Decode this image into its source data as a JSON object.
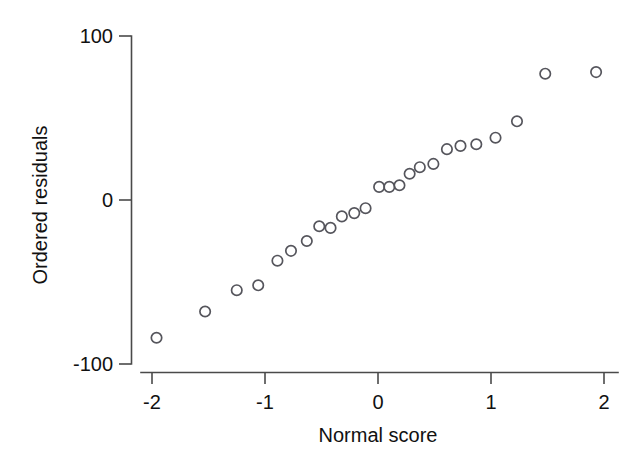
{
  "figure": {
    "type": "normal-probability-plot",
    "background_color": "#ffffff",
    "marker_color": "#55555c",
    "axis_color": "#4a4a4a",
    "text_color": "#111111"
  },
  "chart_data": {
    "type": "scatter",
    "title": "",
    "subtitle": "",
    "xlabel": "Normal score",
    "ylabel": "Ordered residuals",
    "xlim": [
      -2.25,
      2.2
    ],
    "ylim": [
      -110,
      108
    ],
    "xticks": [
      -2,
      -1,
      0,
      1,
      2
    ],
    "xticklabels": [
      "-2",
      "-1",
      "0",
      "1",
      "2"
    ],
    "yticks": [
      -100,
      0,
      100
    ],
    "yticklabels": [
      "-100",
      "0",
      "100"
    ],
    "grid": false,
    "legend": null,
    "marker": "open-circle",
    "series": [
      {
        "name": "ordered residuals",
        "x": [
          -1.96,
          -1.53,
          -1.25,
          -1.06,
          -0.89,
          -0.77,
          -0.63,
          -0.52,
          -0.42,
          -0.32,
          -0.21,
          -0.11,
          0.01,
          0.1,
          0.19,
          0.28,
          0.37,
          0.49,
          0.61,
          0.73,
          0.87,
          1.04,
          1.23,
          1.48,
          1.93
        ],
        "y": [
          -84,
          -68,
          -55,
          -52,
          -37,
          -31,
          -25,
          -16,
          -17,
          -10,
          -8,
          -5,
          8,
          8,
          9,
          16,
          20,
          22,
          31,
          33,
          34,
          38,
          48,
          77,
          78
        ]
      }
    ],
    "n_points": 25
  },
  "labels": {
    "y_top": "100",
    "y_mid": "0",
    "y_bottom": "-100",
    "x_m2": "-2",
    "x_m1": "-1",
    "x_0": "0",
    "x_1": "1",
    "x_2": "2",
    "x_axis_title": "Normal score",
    "y_axis_title": "Ordered residuals"
  }
}
